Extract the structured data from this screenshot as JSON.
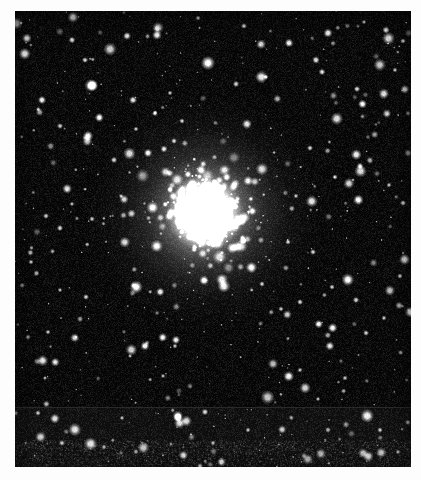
{
  "document": {
    "kind": "astronomical-photographic-plate",
    "subject": "globular star cluster",
    "rendering": "grayscale halftone scan",
    "page_background": "#fdfdfd",
    "width": 421,
    "height": 480
  },
  "plate": {
    "name": "globular-cluster-plate",
    "frame": {
      "x": 15,
      "y": 11,
      "width": 396,
      "height": 456
    },
    "sky_background": "#050505",
    "vignette_color": "#000000",
    "noise_amount": 0.16,
    "grain_color": "#1a1a1a",
    "seam": {
      "present": true,
      "y": 407,
      "thickness": 1,
      "color": "#2a2a2a",
      "lower_band_tint": "#0a0a0a"
    },
    "bottom_grain_band": {
      "y": 440,
      "height": 26,
      "density": 0.5
    }
  },
  "cluster": {
    "name": "cluster-core",
    "center_x": 205,
    "center_y": 213,
    "core_radius": 26,
    "halo_radius": 78,
    "outer_radius": 118,
    "core_color": "#ffffff",
    "halo_color": "#f2f2f2",
    "member_star_count": 520,
    "member_sigma": 34,
    "member_min_size": 1.0,
    "member_max_size": 5.2
  },
  "field": {
    "name": "field-star-population",
    "star_count": 470,
    "min_size": 0.9,
    "max_size": 6.4,
    "bright_fraction": 0.18,
    "color_bright": "#ffffff",
    "color_mid": "#d8d8d8",
    "color_faint": "#8a8a8a"
  },
  "chart_data": {
    "type": "scatter",
    "title": "",
    "xlabel": "",
    "ylabel": "",
    "xlim": [
      15,
      411
    ],
    "ylim": [
      11,
      467
    ],
    "grid": false,
    "legend": null,
    "series": [
      {
        "name": "bright-field-stars",
        "note": "Manually read bright point sources, x/y in screenshot pixels, size = apparent disk diameter in px, b = brightness 0-1",
        "points": [
          {
            "x": 208,
            "y": 63,
            "size": 7.2,
            "b": 1.0
          },
          {
            "x": 157,
            "y": 35,
            "size": 4.8,
            "b": 0.95
          },
          {
            "x": 127,
            "y": 36,
            "size": 4.0,
            "b": 0.9
          },
          {
            "x": 72,
            "y": 40,
            "size": 3.4,
            "b": 0.82
          },
          {
            "x": 289,
            "y": 43,
            "size": 4.4,
            "b": 0.93
          },
          {
            "x": 328,
            "y": 33,
            "size": 4.6,
            "b": 0.95
          },
          {
            "x": 244,
            "y": 26,
            "size": 3.0,
            "b": 0.78
          },
          {
            "x": 198,
            "y": 18,
            "size": 2.6,
            "b": 0.72
          },
          {
            "x": 386,
            "y": 30,
            "size": 3.6,
            "b": 0.86
          },
          {
            "x": 403,
            "y": 41,
            "size": 2.8,
            "b": 0.75
          },
          {
            "x": 364,
            "y": 22,
            "size": 2.4,
            "b": 0.7
          },
          {
            "x": 42,
            "y": 100,
            "size": 4.2,
            "b": 0.92
          },
          {
            "x": 85,
            "y": 60,
            "size": 3.0,
            "b": 0.8
          },
          {
            "x": 133,
            "y": 100,
            "size": 4.0,
            "b": 0.9
          },
          {
            "x": 170,
            "y": 93,
            "size": 2.6,
            "b": 0.74
          },
          {
            "x": 236,
            "y": 84,
            "size": 3.2,
            "b": 0.82
          },
          {
            "x": 266,
            "y": 77,
            "size": 2.6,
            "b": 0.73
          },
          {
            "x": 316,
            "y": 60,
            "size": 3.8,
            "b": 0.88
          },
          {
            "x": 322,
            "y": 72,
            "size": 3.4,
            "b": 0.84
          },
          {
            "x": 357,
            "y": 89,
            "size": 3.2,
            "b": 0.83
          },
          {
            "x": 395,
            "y": 70,
            "size": 2.6,
            "b": 0.74
          },
          {
            "x": 60,
            "y": 126,
            "size": 3.0,
            "b": 0.79
          },
          {
            "x": 88,
            "y": 136,
            "size": 5.2,
            "b": 0.97
          },
          {
            "x": 114,
            "y": 160,
            "size": 3.2,
            "b": 0.82
          },
          {
            "x": 136,
            "y": 129,
            "size": 2.6,
            "b": 0.74
          },
          {
            "x": 182,
            "y": 121,
            "size": 2.8,
            "b": 0.76
          },
          {
            "x": 148,
            "y": 153,
            "size": 4.4,
            "b": 0.93
          },
          {
            "x": 164,
            "y": 149,
            "size": 3.6,
            "b": 0.86
          },
          {
            "x": 174,
            "y": 141,
            "size": 3.0,
            "b": 0.8
          },
          {
            "x": 121,
            "y": 196,
            "size": 2.4,
            "b": 0.7
          },
          {
            "x": 46,
            "y": 216,
            "size": 3.0,
            "b": 0.79
          },
          {
            "x": 60,
            "y": 228,
            "size": 3.2,
            "b": 0.82
          },
          {
            "x": 72,
            "y": 204,
            "size": 2.4,
            "b": 0.7
          },
          {
            "x": 92,
            "y": 219,
            "size": 2.8,
            "b": 0.76
          },
          {
            "x": 31,
            "y": 262,
            "size": 2.6,
            "b": 0.73
          },
          {
            "x": 60,
            "y": 290,
            "size": 2.4,
            "b": 0.7
          },
          {
            "x": 86,
            "y": 297,
            "size": 3.0,
            "b": 0.79
          },
          {
            "x": 48,
            "y": 332,
            "size": 2.6,
            "b": 0.73
          },
          {
            "x": 45,
            "y": 378,
            "size": 2.2,
            "b": 0.67
          },
          {
            "x": 38,
            "y": 413,
            "size": 2.8,
            "b": 0.76
          },
          {
            "x": 62,
            "y": 443,
            "size": 3.0,
            "b": 0.79
          },
          {
            "x": 104,
            "y": 447,
            "size": 2.6,
            "b": 0.72
          },
          {
            "x": 122,
            "y": 418,
            "size": 2.4,
            "b": 0.7
          },
          {
            "x": 130,
            "y": 356,
            "size": 2.2,
            "b": 0.67
          },
          {
            "x": 163,
            "y": 376,
            "size": 2.4,
            "b": 0.7
          },
          {
            "x": 175,
            "y": 346,
            "size": 2.6,
            "b": 0.73
          },
          {
            "x": 205,
            "y": 412,
            "size": 3.4,
            "b": 0.86
          },
          {
            "x": 213,
            "y": 443,
            "size": 2.6,
            "b": 0.73
          },
          {
            "x": 248,
            "y": 430,
            "size": 2.6,
            "b": 0.73
          },
          {
            "x": 200,
            "y": 466,
            "size": 3.0,
            "b": 0.8
          },
          {
            "x": 281,
            "y": 309,
            "size": 2.6,
            "b": 0.74
          },
          {
            "x": 262,
            "y": 284,
            "size": 2.8,
            "b": 0.76
          },
          {
            "x": 300,
            "y": 302,
            "size": 3.0,
            "b": 0.8
          },
          {
            "x": 332,
            "y": 287,
            "size": 2.8,
            "b": 0.77
          },
          {
            "x": 356,
            "y": 300,
            "size": 3.2,
            "b": 0.82
          },
          {
            "x": 366,
            "y": 333,
            "size": 3.0,
            "b": 0.79
          },
          {
            "x": 384,
            "y": 318,
            "size": 2.6,
            "b": 0.73
          },
          {
            "x": 400,
            "y": 276,
            "size": 2.8,
            "b": 0.76
          },
          {
            "x": 345,
            "y": 378,
            "size": 2.6,
            "b": 0.74
          },
          {
            "x": 318,
            "y": 399,
            "size": 2.4,
            "b": 0.7
          },
          {
            "x": 300,
            "y": 370,
            "size": 2.6,
            "b": 0.73
          },
          {
            "x": 380,
            "y": 430,
            "size": 2.8,
            "b": 0.77
          },
          {
            "x": 398,
            "y": 452,
            "size": 2.6,
            "b": 0.73
          },
          {
            "x": 403,
            "y": 203,
            "size": 3.0,
            "b": 0.79
          },
          {
            "x": 389,
            "y": 185,
            "size": 2.6,
            "b": 0.73
          },
          {
            "x": 360,
            "y": 166,
            "size": 3.4,
            "b": 0.85
          },
          {
            "x": 335,
            "y": 177,
            "size": 2.8,
            "b": 0.76
          },
          {
            "x": 310,
            "y": 148,
            "size": 3.0,
            "b": 0.8
          },
          {
            "x": 296,
            "y": 196,
            "size": 2.6,
            "b": 0.73
          },
          {
            "x": 288,
            "y": 242,
            "size": 2.8,
            "b": 0.77
          },
          {
            "x": 313,
            "y": 252,
            "size": 3.0,
            "b": 0.8
          }
        ]
      }
    ]
  }
}
